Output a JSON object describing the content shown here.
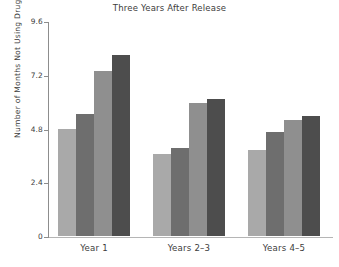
{
  "chart_data": {
    "type": "bar",
    "title": "Three Years After Release",
    "xlabel": "",
    "ylabel": "Number of Months Not Using Drugs",
    "categories": [
      "Year 1",
      "Years 2–3",
      "Years 4–5"
    ],
    "series": [
      {
        "name": "Series 1",
        "color": "#a9a9a9",
        "values": [
          4.8,
          3.65,
          3.85
        ]
      },
      {
        "name": "Series 2",
        "color": "#6e6e6e",
        "values": [
          5.45,
          3.95,
          4.65
        ]
      },
      {
        "name": "Series 3",
        "color": "#8f8f8f",
        "values": [
          7.35,
          5.95,
          5.2
        ]
      },
      {
        "name": "Series 4",
        "color": "#4d4d4d",
        "values": [
          8.1,
          6.1,
          5.35
        ]
      }
    ],
    "ylim": [
      0,
      9.6
    ],
    "yticks": [
      0,
      2.4,
      4.8,
      7.2,
      9.6
    ],
    "ytick_labels": [
      "0",
      "2.4",
      "4.8",
      "7.2",
      "9.6"
    ],
    "grid": false,
    "legend": "none",
    "axis_color": "#8d8d8d"
  }
}
